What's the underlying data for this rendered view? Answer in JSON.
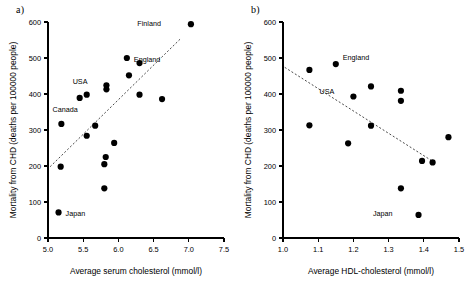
{
  "figure": {
    "panels": [
      {
        "id": "a",
        "label": "a)",
        "chart_data": {
          "type": "scatter",
          "title": "",
          "xlabel": "Average serum cholesterol (mmol/l)",
          "ylabel": "Mortality from CHD (deaths per 100000 people)",
          "xlim": [
            5.0,
            7.5
          ],
          "ylim": [
            0,
            600
          ],
          "xticks": [
            "5.0",
            "5.5",
            "6.0",
            "6.5",
            "7.0",
            "7.5"
          ],
          "yticks": [
            "0",
            "100",
            "200",
            "300",
            "400",
            "500",
            "600"
          ],
          "xtick_values": [
            5.0,
            5.5,
            6.0,
            6.5,
            7.0,
            7.5
          ],
          "ytick_values": [
            0,
            100,
            200,
            300,
            400,
            500,
            600
          ],
          "grid": false,
          "legend": "none",
          "points": [
            {
              "x": 5.18,
              "y": 198,
              "label": ""
            },
            {
              "x": 5.19,
              "y": 317,
              "label": ""
            },
            {
              "x": 5.15,
              "y": 71,
              "label": "Japan",
              "label_dx": 7,
              "label_dy": 3.5
            },
            {
              "x": 5.45,
              "y": 389,
              "label": "Canada",
              "label_dx": -2,
              "label_dy": 14
            },
            {
              "x": 5.55,
              "y": 398,
              "label": ""
            },
            {
              "x": 5.55,
              "y": 284,
              "label": ""
            },
            {
              "x": 5.67,
              "y": 312,
              "label": ""
            },
            {
              "x": 5.83,
              "y": 424,
              "label": "USA",
              "label_dx": -19,
              "label_dy": -1
            },
            {
              "x": 5.83,
              "y": 413,
              "label": ""
            },
            {
              "x": 5.8,
              "y": 205,
              "label": ""
            },
            {
              "x": 5.82,
              "y": 225,
              "label": ""
            },
            {
              "x": 5.8,
              "y": 138,
              "label": ""
            },
            {
              "x": 5.94,
              "y": 264,
              "label": ""
            },
            {
              "x": 6.12,
              "y": 500,
              "label": "England",
              "label_dx": 7,
              "label_dy": 3.5
            },
            {
              "x": 6.15,
              "y": 452,
              "label": ""
            },
            {
              "x": 6.3,
              "y": 486,
              "label": ""
            },
            {
              "x": 6.3,
              "y": 398,
              "label": ""
            },
            {
              "x": 6.62,
              "y": 386,
              "label": ""
            },
            {
              "x": 7.03,
              "y": 594,
              "label": "Finland",
              "label_dx": -30,
              "label_dy": 2
            }
          ],
          "trendline": {
            "x1": 5.03,
            "y1": 198,
            "x2": 6.88,
            "y2": 553
          }
        }
      },
      {
        "id": "b",
        "label": "b)",
        "chart_data": {
          "type": "scatter",
          "title": "",
          "xlabel": "Average HDL-cholesterol (mmol/l)",
          "ylabel": "Mortality from CHD (deaths per 100000 people)",
          "xlim": [
            1.0,
            1.5
          ],
          "ylim": [
            0,
            600
          ],
          "xticks": [
            "1.0",
            "1.1",
            "1.2",
            "1.3",
            "1.4",
            "1.5"
          ],
          "yticks": [
            "0",
            "100",
            "200",
            "300",
            "400",
            "500",
            "600"
          ],
          "xtick_values": [
            1.0,
            1.1,
            1.2,
            1.3,
            1.4,
            1.5
          ],
          "ytick_values": [
            0,
            100,
            200,
            300,
            400,
            500,
            600
          ],
          "grid": false,
          "legend": "none",
          "points": [
            {
              "x": 1.075,
              "y": 467,
              "label": ""
            },
            {
              "x": 1.075,
              "y": 313,
              "label": ""
            },
            {
              "x": 1.15,
              "y": 483,
              "label": "England",
              "label_dx": 7,
              "label_dy": -4
            },
            {
              "x": 1.185,
              "y": 263,
              "label": ""
            },
            {
              "x": 1.2,
              "y": 393,
              "label": "USA",
              "label_dx": -19,
              "label_dy": -3
            },
            {
              "x": 1.25,
              "y": 421,
              "label": ""
            },
            {
              "x": 1.25,
              "y": 312,
              "label": ""
            },
            {
              "x": 1.335,
              "y": 409,
              "label": ""
            },
            {
              "x": 1.335,
              "y": 381,
              "label": ""
            },
            {
              "x": 1.335,
              "y": 138,
              "label": ""
            },
            {
              "x": 1.395,
              "y": 214,
              "label": ""
            },
            {
              "x": 1.425,
              "y": 210,
              "label": ""
            },
            {
              "x": 1.47,
              "y": 280,
              "label": ""
            },
            {
              "x": 1.385,
              "y": 64,
              "label": "Japan",
              "label_dx": -26,
              "label_dy": 1
            }
          ],
          "trendline": {
            "x1": 1.005,
            "y1": 474,
            "x2": 1.435,
            "y2": 207
          }
        }
      }
    ]
  }
}
